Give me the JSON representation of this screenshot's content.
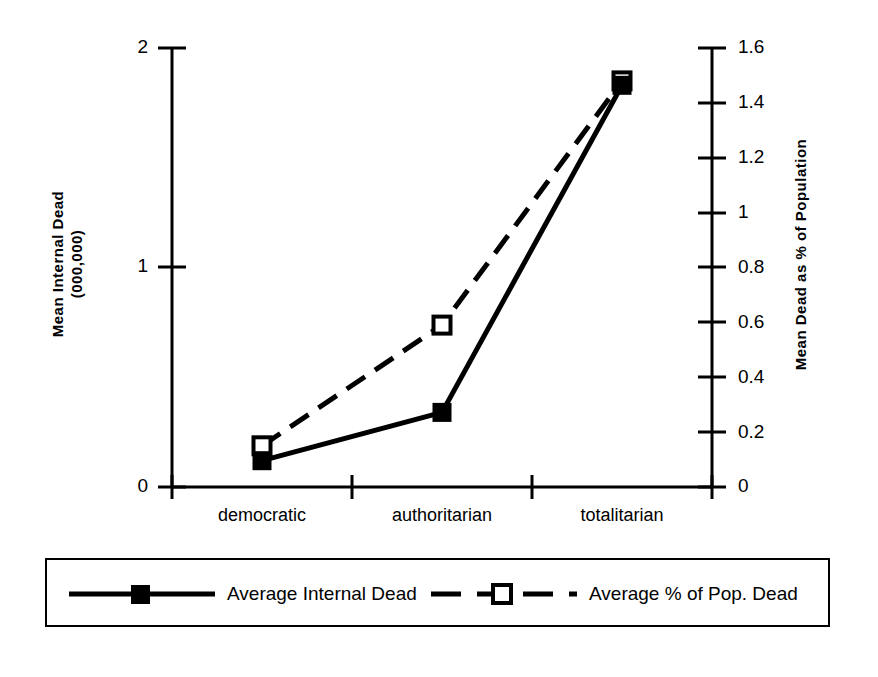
{
  "chart_data": {
    "type": "line",
    "title": "",
    "categories": [
      "democratic",
      "authoritarian",
      "totalitarian"
    ],
    "xlabel": "",
    "series": [
      {
        "name": "Average Internal Dead",
        "axis": "left",
        "marker": "filled-square",
        "line_style": "solid",
        "values": [
          0.12,
          0.34,
          1.83
        ]
      },
      {
        "name": "Average % of Pop. Dead",
        "axis": "right",
        "marker": "open-square",
        "line_style": "dashed",
        "values": [
          0.15,
          0.59,
          1.48
        ]
      }
    ],
    "left_axis": {
      "label": "Mean Internal Dead (000,000)",
      "label_line1": "Mean Internal Dead",
      "label_line2": "(000,000)",
      "ticks": [
        "0",
        "1",
        "2"
      ],
      "tick_values": [
        0,
        1,
        2
      ],
      "ylim": [
        0,
        2
      ]
    },
    "right_axis": {
      "label": "Mean Dead as % of Population",
      "ticks": [
        "0",
        "0.2",
        "0.4",
        "0.6",
        "0.8",
        "1",
        "1.2",
        "1.4",
        "1.6"
      ],
      "tick_values": [
        0,
        0.2,
        0.4,
        0.6,
        0.8,
        1,
        1.2,
        1.4,
        1.6
      ],
      "ylim": [
        0,
        1.6
      ]
    },
    "legend": {
      "position": "bottom",
      "entries": [
        {
          "label": "Average Internal Dead",
          "marker": "filled-square",
          "line_style": "solid"
        },
        {
          "label": "Average % of Pop. Dead",
          "marker": "open-square",
          "line_style": "dashed"
        }
      ]
    },
    "grid": false,
    "colors": {
      "line": "#000000",
      "background": "#ffffff"
    }
  }
}
